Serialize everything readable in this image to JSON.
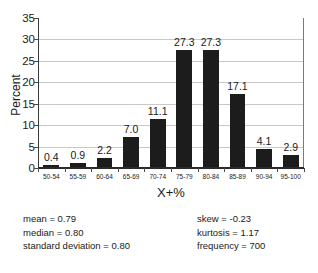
{
  "chart_data": {
    "type": "bar",
    "title": "",
    "xlabel": "X+%",
    "ylabel": "Percent",
    "categories": [
      "50-54",
      "55-59",
      "60-64",
      "65-69",
      "70-74",
      "75-79",
      "80-84",
      "85-89",
      "90-94",
      "95-100"
    ],
    "values": [
      0.4,
      0.9,
      2.2,
      7.0,
      11.1,
      27.3,
      27.3,
      17.1,
      4.1,
      2.9
    ],
    "value_labels": [
      "0.4",
      "0.9",
      "2.2",
      "7.0",
      "11.1",
      "27.3",
      "27.3",
      "17.1",
      "4.1",
      "2.9"
    ],
    "ylim": [
      0,
      35
    ],
    "yticks": [
      0,
      5,
      10,
      15,
      20,
      25,
      30,
      35
    ],
    "ytick_labels": [
      "0",
      "5",
      "10",
      "15",
      "20",
      "25",
      "30",
      "35"
    ],
    "grid": true,
    "legend": "none",
    "bar_color": "#1c1c1c",
    "grid_color": "#c8c8c8",
    "axis_color": "#2a2a2a"
  },
  "stats": {
    "left": [
      "mean  =  0.79",
      "median  =  0.80",
      "standard deviation  =  0.80"
    ],
    "right": [
      "skew  =  -0.23",
      "kurtosis  =  1.17",
      "frequency  =  700"
    ]
  }
}
